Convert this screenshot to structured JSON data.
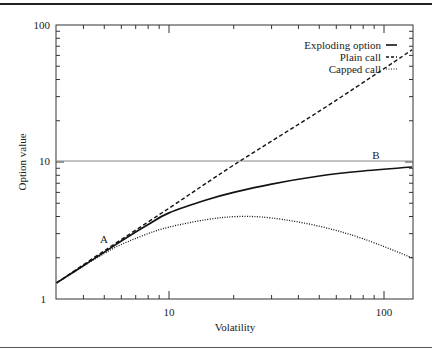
{
  "chart_data": {
    "type": "line",
    "title": "",
    "xlabel": "Volatility",
    "ylabel": "Option value",
    "xscale": "log",
    "yscale": "log",
    "xlim": [
      3,
      135
    ],
    "ylim": [
      1,
      100
    ],
    "x_ticks": [
      10,
      100
    ],
    "y_ticks": [
      1,
      10,
      100
    ],
    "grid": false,
    "legend_position": "upper right",
    "reference_line": {
      "y": 10,
      "color": "#777777"
    },
    "series": [
      {
        "name": "Exploding option",
        "style": "solid",
        "x": [
          3,
          4,
          5,
          6,
          8,
          10,
          15,
          20,
          30,
          50,
          80,
          135
        ],
        "y": [
          1.31,
          1.75,
          2.2,
          2.65,
          3.5,
          4.25,
          5.3,
          6.0,
          6.9,
          7.9,
          8.6,
          9.2
        ]
      },
      {
        "name": "Plain call",
        "style": "dashed",
        "x": [
          3,
          5,
          10,
          20,
          50,
          100,
          135
        ],
        "y": [
          1.31,
          2.25,
          4.6,
          9.5,
          23.5,
          48,
          66
        ]
      },
      {
        "name": "Capped call",
        "style": "dotted",
        "x": [
          3,
          4,
          5,
          6,
          8,
          10,
          15,
          21,
          30,
          50,
          80,
          135
        ],
        "y": [
          1.31,
          1.74,
          2.15,
          2.5,
          3.0,
          3.35,
          3.8,
          4.0,
          3.9,
          3.4,
          2.75,
          2.0
        ]
      }
    ],
    "annotations": [
      {
        "text": "A",
        "x": 4.5,
        "y": 2.7
      },
      {
        "text": "B",
        "x": 82,
        "y": 11.2
      }
    ]
  },
  "axis_labels": {
    "x_tick_10": "10",
    "x_tick_100": "100",
    "y_tick_1": "1",
    "y_tick_10": "10",
    "y_tick_100": "100",
    "xlabel": "Volatility",
    "ylabel": "Option value"
  },
  "legend": [
    {
      "label": "Exploding option",
      "style": "solid"
    },
    {
      "label": "Plain call",
      "style": "dashed"
    },
    {
      "label": "Capped call",
      "style": "dotted"
    }
  ],
  "annotation_labels": {
    "a": "A",
    "b": "B"
  }
}
